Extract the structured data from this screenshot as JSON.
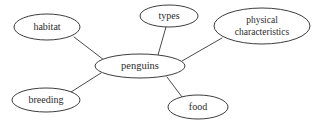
{
  "diagram": {
    "type": "mind-map",
    "title": "penguins",
    "background_color": "#ffffff",
    "node_fill_color": "#ffffff",
    "node_stroke_color": "#3d3d3d",
    "edge_color": "#4a4a4a",
    "text_color": "#2b2b2b",
    "center": {
      "id": "penguins",
      "label": "penguins",
      "cx": 140,
      "cy": 66,
      "rx": 45,
      "ry": 12
    },
    "nodes": [
      {
        "id": "habitat",
        "label": "habitat",
        "cx": 47,
        "cy": 27,
        "rx": 33,
        "ry": 13,
        "lines": [
          "habitat"
        ]
      },
      {
        "id": "types",
        "label": "types",
        "cx": 169,
        "cy": 16,
        "rx": 29,
        "ry": 11,
        "lines": [
          "types"
        ]
      },
      {
        "id": "physical-characteristics",
        "label": "physical characteristics",
        "cx": 262,
        "cy": 26,
        "rx": 48,
        "ry": 18,
        "lines": [
          "physical",
          "characteristics"
        ]
      },
      {
        "id": "breeding",
        "label": "breeding",
        "cx": 46,
        "cy": 100,
        "rx": 34,
        "ry": 12,
        "lines": [
          "breeding"
        ]
      },
      {
        "id": "food",
        "label": "food",
        "cx": 198,
        "cy": 107,
        "rx": 30,
        "ry": 12,
        "lines": [
          "food"
        ]
      }
    ],
    "edges": [
      {
        "id": "edge-habitat",
        "from": "habitat",
        "to": "penguins",
        "x1": 74,
        "y1": 37,
        "x2": 104,
        "y2": 60
      },
      {
        "id": "edge-types",
        "from": "types",
        "to": "penguins",
        "x1": 166,
        "y1": 27,
        "x2": 158,
        "y2": 55
      },
      {
        "id": "edge-physical",
        "from": "physical-characteristics",
        "to": "penguins",
        "x1": 222,
        "y1": 38,
        "x2": 182,
        "y2": 61
      },
      {
        "id": "edge-breeding",
        "from": "breeding",
        "to": "penguins",
        "x1": 71,
        "y1": 92,
        "x2": 101,
        "y2": 73
      },
      {
        "id": "edge-food",
        "from": "food",
        "to": "penguins",
        "x1": 182,
        "y1": 97,
        "x2": 167,
        "y2": 77
      }
    ]
  }
}
